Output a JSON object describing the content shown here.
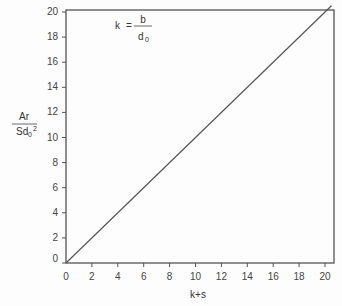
{
  "chart_data": {
    "type": "line",
    "title": "",
    "annotation": {
      "lhs": "k",
      "equals": "=",
      "numerator": "b",
      "denominator": "d",
      "denominator_subscript": "0"
    },
    "xlabel": "k+s",
    "ylabel": {
      "numerator": "Ar",
      "denominator": "Sd",
      "denominator_subscript": "0",
      "denominator_superscript": "2"
    },
    "xlim": [
      0,
      20
    ],
    "ylim": [
      0,
      20
    ],
    "xticks": [
      "0",
      "2",
      "4",
      "6",
      "8",
      "10",
      "12",
      "14",
      "16",
      "18",
      "20"
    ],
    "yticks": [
      "0",
      "2",
      "4",
      "6",
      "8",
      "10",
      "12",
      "14",
      "16",
      "18",
      "20"
    ],
    "grid": false,
    "legend": null,
    "series": [
      {
        "name": "Ar/Sd0^2 vs k+s",
        "x": [
          0,
          20.5
        ],
        "y": [
          0,
          20.5
        ]
      }
    ],
    "colors": {
      "line": "#555555",
      "frame": "#555555"
    }
  }
}
